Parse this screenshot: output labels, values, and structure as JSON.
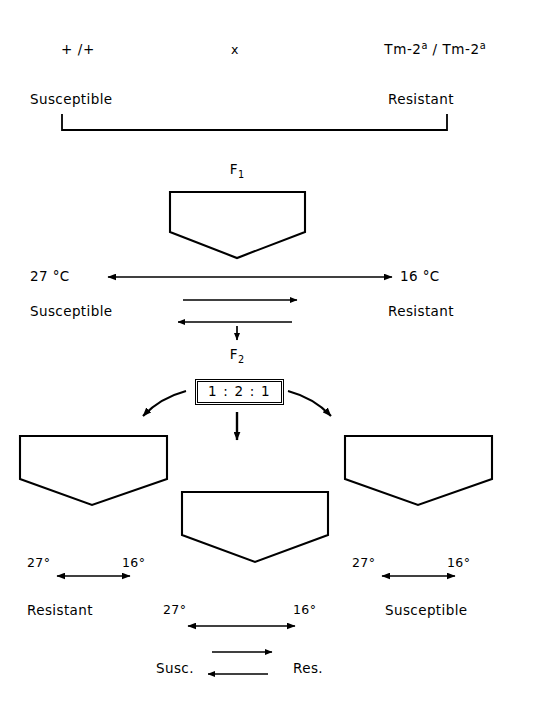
{
  "figure": {
    "type": "genetic-cross-diagram",
    "organism_trait": "Tomato Tm-2a resistance, temperature-dependent expression",
    "ink_color": "#000000",
    "background_color": "#ffffff"
  },
  "parents": {
    "left_genotype": "+ /+",
    "cross_symbol": "x",
    "right_genotype_prefix": "Tm-2",
    "right_genotype_sup": "a",
    "right_genotype_mid": " / Tm-2",
    "right_genotype_sup2": "a",
    "left_phenotype": "Susceptible",
    "right_phenotype": "Resistant"
  },
  "f1": {
    "generation_label": "F",
    "generation_sub": "1",
    "genotype_prefix": "Tm-2",
    "genotype_sup": "a",
    "genotype_suffix": " / +",
    "left_temperature": "27 °C",
    "right_temperature": "16 °C",
    "left_phenotype": "Susceptible",
    "right_phenotype": "Resistant"
  },
  "f2": {
    "generation_label": "F",
    "generation_sub": "2",
    "ratio": "1 : 2 : 1",
    "classes": [
      {
        "position": "left",
        "genotype_prefix": "Tm-2",
        "genotype_sup": "a",
        "genotype_mid": " / Tm-2",
        "genotype_sup2": "a",
        "left_temperature": "27°",
        "right_temperature": "16°",
        "phenotype": "Resistant"
      },
      {
        "position": "center",
        "genotype_prefix": "Tm-2",
        "genotype_sup": "a",
        "genotype_suffix": " / +",
        "left_temperature": "27°",
        "right_temperature": "16°",
        "low_temp_phenotype": "Susc.",
        "high_temp_phenotype": "Res."
      },
      {
        "position": "right",
        "genotype": "+ / +",
        "left_temperature": "27°",
        "right_temperature": "16°",
        "phenotype": "Susceptible"
      }
    ]
  }
}
